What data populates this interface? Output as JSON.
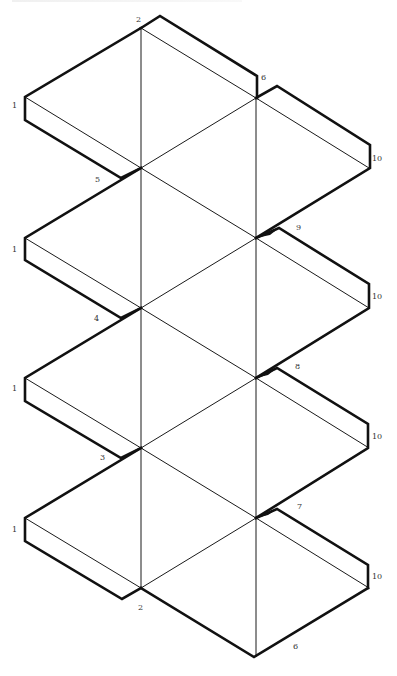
{
  "diagram": {
    "type": "paper-net",
    "colors": {
      "line": "#111111",
      "background": "#ffffff",
      "label": "#333333"
    },
    "labels": [
      {
        "id": "top-2",
        "text": "2",
        "x": 136,
        "y": 22
      },
      {
        "id": "right-6-top",
        "text": "6",
        "x": 261,
        "y": 80
      },
      {
        "id": "left-1-a",
        "text": "1",
        "x": 12,
        "y": 108
      },
      {
        "id": "right-10-a",
        "text": "10",
        "x": 372,
        "y": 161
      },
      {
        "id": "left-5",
        "text": "5",
        "x": 95,
        "y": 182
      },
      {
        "id": "right-9",
        "text": "9",
        "x": 296,
        "y": 230
      },
      {
        "id": "left-1-b",
        "text": "1",
        "x": 12,
        "y": 252
      },
      {
        "id": "right-10-b",
        "text": "10",
        "x": 372,
        "y": 299
      },
      {
        "id": "left-4",
        "text": "4",
        "x": 94,
        "y": 321
      },
      {
        "id": "right-8",
        "text": "8",
        "x": 295,
        "y": 369
      },
      {
        "id": "left-1-c",
        "text": "1",
        "x": 12,
        "y": 391
      },
      {
        "id": "right-10-c",
        "text": "10",
        "x": 372,
        "y": 439
      },
      {
        "id": "left-3",
        "text": "3",
        "x": 100,
        "y": 460
      },
      {
        "id": "right-7",
        "text": "7",
        "x": 297,
        "y": 509
      },
      {
        "id": "left-1-d",
        "text": "1",
        "x": 12,
        "y": 532
      },
      {
        "id": "right-10-d",
        "text": "10",
        "x": 372,
        "y": 579
      },
      {
        "id": "bottom-2",
        "text": "2",
        "x": 138,
        "y": 610
      },
      {
        "id": "bottom-6",
        "text": "6",
        "x": 293,
        "y": 649
      }
    ]
  }
}
